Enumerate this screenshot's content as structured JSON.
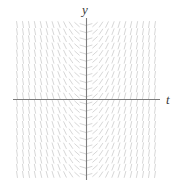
{
  "figure": {
    "width": 178,
    "height": 187,
    "background": "#ffffff",
    "axis_color": "#7d7d7d",
    "field_color": "#d2d2d2"
  },
  "axes": {
    "horizontal": {
      "label": "t",
      "y_pixel": 99,
      "x_start_pixel": 13,
      "x_end_pixel": 160
    },
    "vertical": {
      "label": "y",
      "x_pixel": 86,
      "y_start_pixel": 18,
      "y_end_pixel": 180
    }
  },
  "chart_data": {
    "type": "scatter",
    "subtype": "slope-field",
    "title": "",
    "xlabel": "t",
    "ylabel": "y",
    "equation": "dy/dt = t",
    "xlim": [
      -6,
      6
    ],
    "ylim": [
      -5.5,
      5.5
    ],
    "grid": false,
    "legend": null,
    "field": {
      "x_values": [
        -5.75,
        -5.25,
        -4.75,
        -4.25,
        -3.75,
        -3.25,
        -2.75,
        -2.25,
        -1.75,
        -1.25,
        -0.75,
        -0.25,
        0.25,
        0.75,
        1.25,
        1.75,
        2.25,
        2.75,
        3.25,
        3.75,
        4.25,
        4.75,
        5.25,
        5.75
      ],
      "y_values": [
        -5.25,
        -4.75,
        -4.25,
        -3.75,
        -3.25,
        -2.75,
        -2.25,
        -1.75,
        -1.25,
        -0.75,
        -0.25,
        0.25,
        0.75,
        1.25,
        1.75,
        2.25,
        2.75,
        3.25,
        3.75,
        4.25,
        4.75,
        5.25
      ],
      "slope_rule": "slope = t",
      "slopes_by_x": [
        -5.75,
        -5.25,
        -4.75,
        -4.25,
        -3.75,
        -3.25,
        -2.75,
        -2.25,
        -1.75,
        -1.25,
        -0.75,
        -0.25,
        0.25,
        0.75,
        1.25,
        1.75,
        2.25,
        2.75,
        3.25,
        3.75,
        4.25,
        4.75,
        5.25,
        5.75
      ],
      "mark_length_px": 6.2,
      "x_spacing_px": 6.2,
      "y_spacing_px": 7.2,
      "x_range_px": [
        14,
        158
      ],
      "y_range_px": [
        21,
        178
      ]
    }
  }
}
